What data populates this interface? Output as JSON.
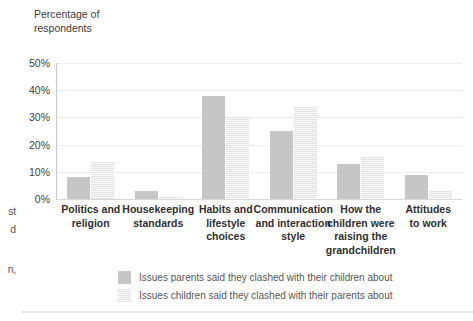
{
  "axis_title": "Percentage of\nrespondents",
  "margin_fragments": [
    "st",
    "d",
    "n,"
  ],
  "colors": {
    "series_parents": "#c6c6c6",
    "series_children": "#e4e4e4",
    "gridline": "#ececeb",
    "axis": "#c9c9c7",
    "text": "#3c3c3c"
  },
  "chart_data": {
    "type": "bar",
    "title": "",
    "xlabel": "",
    "ylabel": "Percentage of respondents",
    "ylim": [
      0,
      50
    ],
    "ytick_labels": [
      "0%",
      "10%",
      "20%",
      "30%",
      "40%",
      "50%"
    ],
    "ytick_values": [
      0,
      10,
      20,
      30,
      40,
      50
    ],
    "grid": true,
    "legend_position": "bottom",
    "categories": [
      "Politics and religion",
      "Housekeeping standards",
      "Habits and lifestyle choices",
      "Communication and interaction style",
      "How the children were raising the grandchildren",
      "Attitudes to work"
    ],
    "category_lines": [
      [
        "Politics and",
        "religion"
      ],
      [
        "Housekeeping",
        "standards"
      ],
      [
        "Habits and",
        "lifestyle",
        "choices"
      ],
      [
        "Communication",
        "and interaction",
        "style"
      ],
      [
        "How the",
        "children were",
        "raising the",
        "grandchildren"
      ],
      [
        "Attitudes",
        "to work"
      ]
    ],
    "series": [
      {
        "name": "Issues parents said they clashed with their children about",
        "values": [
          8,
          3,
          38,
          25,
          13,
          9
        ]
      },
      {
        "name": "Issues children said they clashed with their parents about",
        "values": [
          13.5,
          0.8,
          30,
          34,
          15.5,
          3
        ]
      }
    ]
  },
  "legend": [
    {
      "label": "Issues parents said they clashed with their children about"
    },
    {
      "label": "Issues children said they clashed with their parents about"
    }
  ]
}
